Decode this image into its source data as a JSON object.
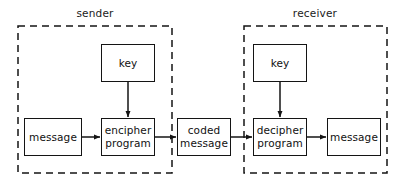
{
  "diagram": {
    "background_color": "#ffffff",
    "stroke_color": "#141414",
    "zones": [
      {
        "id": "sender",
        "label": "sender",
        "label_x": 95,
        "label_y": 7,
        "x": 18,
        "y": 26,
        "width": 154,
        "height": 147,
        "border_style": "dashed"
      },
      {
        "id": "receiver",
        "label": "receiver",
        "label_x": 315,
        "label_y": 7,
        "x": 244,
        "y": 26,
        "width": 143,
        "height": 147,
        "border_style": "dashed"
      }
    ],
    "nodes": [
      {
        "id": "sender-key",
        "label": "key",
        "x": 101,
        "y": 44,
        "width": 54,
        "height": 38
      },
      {
        "id": "message-plain-input",
        "label": "message",
        "x": 24,
        "y": 118,
        "width": 58,
        "height": 38
      },
      {
        "id": "encipher-program",
        "label": "encipher\nprogram",
        "x": 101,
        "y": 118,
        "width": 54,
        "height": 38
      },
      {
        "id": "coded-message",
        "label": "coded\nmessage",
        "x": 177,
        "y": 118,
        "width": 54,
        "height": 38
      },
      {
        "id": "receiver-key",
        "label": "key",
        "x": 253,
        "y": 44,
        "width": 54,
        "height": 38
      },
      {
        "id": "decipher-program",
        "label": "decipher\nprogram",
        "x": 253,
        "y": 118,
        "width": 54,
        "height": 38
      },
      {
        "id": "message-plain-output",
        "label": "message",
        "x": 327,
        "y": 118,
        "width": 54,
        "height": 38
      }
    ],
    "connections": [
      {
        "id": "message-to-encipher",
        "from": "message-plain-input",
        "to": "encipher-program",
        "direction": "right",
        "x1": 82,
        "y1": 137,
        "x2": 101,
        "y2": 137
      },
      {
        "id": "sender-key-to-encipher",
        "from": "sender-key",
        "to": "encipher-program",
        "direction": "down",
        "x1": 128,
        "y1": 82,
        "x2": 128,
        "y2": 118
      },
      {
        "id": "encipher-to-coded",
        "from": "encipher-program",
        "to": "coded-message",
        "direction": "right",
        "x1": 155,
        "y1": 137,
        "x2": 177,
        "y2": 137
      },
      {
        "id": "coded-to-decipher",
        "from": "coded-message",
        "to": "decipher-program",
        "direction": "right",
        "x1": 231,
        "y1": 137,
        "x2": 253,
        "y2": 137
      },
      {
        "id": "receiver-key-to-decipher",
        "from": "receiver-key",
        "to": "decipher-program",
        "direction": "down",
        "x1": 280,
        "y1": 82,
        "x2": 280,
        "y2": 118
      },
      {
        "id": "decipher-to-message",
        "from": "decipher-program",
        "to": "message-plain-output",
        "direction": "right",
        "x1": 307,
        "y1": 137,
        "x2": 327,
        "y2": 137
      }
    ]
  }
}
